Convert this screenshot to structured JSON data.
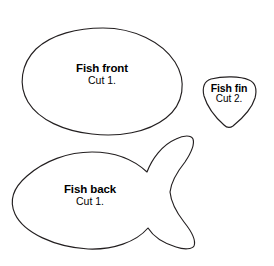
{
  "page": {
    "background_color": "#ffffff",
    "outline_color": "#231f20",
    "fill_color": "#ffffff"
  },
  "pieces": [
    {
      "id": "fish-front",
      "name": "Fish front",
      "cut_instruction": "Cut 1.",
      "shape": "egg-oval"
    },
    {
      "id": "fish-fin",
      "name": "Fish fin",
      "cut_instruction": "Cut 2.",
      "shape": "rounded-triangle"
    },
    {
      "id": "fish-back",
      "name": "Fish back",
      "cut_instruction": "Cut 1.",
      "shape": "fish-body-with-forked-tail"
    }
  ]
}
